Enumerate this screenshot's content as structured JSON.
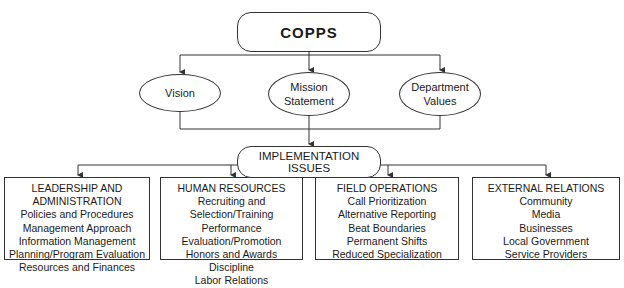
{
  "diagram": {
    "root": {
      "label": "COPPS"
    },
    "foundations": [
      {
        "label": "Vision"
      },
      {
        "label": "Mission Statement",
        "lines": [
          "Mission",
          "Statement"
        ]
      },
      {
        "label": "Department Values",
        "lines": [
          "Department",
          "Values"
        ]
      }
    ],
    "implementation": {
      "label": "IMPLEMENTATION ISSUES"
    },
    "categories": [
      {
        "heading_lines": [
          "LEADERSHIP AND",
          "ADMINISTRATION"
        ],
        "items": [
          "Policies and Procedures",
          "Management Approach",
          "Information Management",
          "Planning/Program Evaluation",
          "Resources and Finances"
        ]
      },
      {
        "heading_lines": [
          "HUMAN RESOURCES"
        ],
        "items": [
          "Recruiting and Selection/Training",
          "Performance Evaluation/Promotion",
          "Honors and Awards",
          "Discipline",
          "Labor Relations"
        ]
      },
      {
        "heading_lines": [
          "FIELD OPERATIONS"
        ],
        "items": [
          "Call Prioritization",
          "Alternative Reporting",
          "Beat Boundaries",
          "Permanent Shifts",
          "Reduced Specialization"
        ]
      },
      {
        "heading_lines": [
          "EXTERNAL RELATIONS"
        ],
        "items": [
          "Community",
          "Media",
          "Businesses",
          "Local Government",
          "Service Providers"
        ]
      }
    ],
    "colors": {
      "line": "#333333",
      "text": "#1a1a1a",
      "background": "#ffffff"
    }
  }
}
